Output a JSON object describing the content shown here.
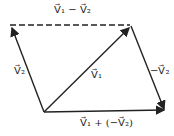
{
  "diagram": {
    "labels": {
      "top": "V⃗₁ − V⃗₂",
      "left": "V⃗₂",
      "diagonal": "V⃗₁",
      "right": "−V⃗₂",
      "bottom": "V⃗₁ + (−V⃗₂)"
    },
    "vectors": [
      {
        "name": "V2",
        "from": [
          44,
          112
        ],
        "to": [
          12,
          27
        ]
      },
      {
        "name": "V1",
        "from": [
          44,
          112
        ],
        "to": [
          130,
          27
        ]
      },
      {
        "name": "V1-V2",
        "from": [
          10,
          25
        ],
        "to": [
          130,
          25
        ],
        "style": "dashed"
      },
      {
        "name": "-V2",
        "from": [
          131,
          27
        ],
        "to": [
          165,
          110
        ]
      },
      {
        "name": "V1+(-V2)",
        "from": [
          44,
          112
        ],
        "to": [
          165,
          110
        ]
      }
    ],
    "colors": {
      "line": "#222222"
    }
  }
}
